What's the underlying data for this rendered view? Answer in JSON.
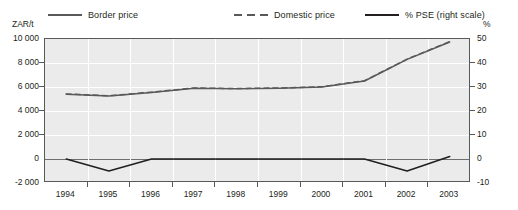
{
  "legend": {
    "items": [
      {
        "label": "Border price",
        "style": "solid",
        "color": "#58595b",
        "x": 48
      },
      {
        "label": "Domestic price",
        "style": "dashed",
        "color": "#58595b",
        "x": 234
      },
      {
        "label": "% PSE (right scale)",
        "style": "solid-thick",
        "color": "#231f20",
        "x": 365
      }
    ]
  },
  "axes": {
    "left_unit": "ZAR/t",
    "right_unit": "%"
  },
  "chart_data": {
    "type": "line",
    "title": "",
    "subtitle": "",
    "xlabel": "",
    "ylabel": "ZAR/t",
    "y2label": "%",
    "grid": true,
    "legend_position": "top",
    "x": [
      1994,
      1995,
      1996,
      1997,
      1998,
      1999,
      2000,
      2001,
      2002,
      2003
    ],
    "xtick_labels": [
      "1994",
      "1995",
      "1996",
      "1997",
      "1998",
      "1999",
      "2000",
      "2001",
      "2002",
      "2003"
    ],
    "ylim": [
      -2000,
      10000
    ],
    "ytick_labels": [
      "10 000",
      "8 000",
      "6 000",
      "4 000",
      "2 000",
      "0",
      "-2 000"
    ],
    "ytick_values": [
      10000,
      8000,
      6000,
      4000,
      2000,
      0,
      -2000
    ],
    "y2lim": [
      -10,
      50
    ],
    "y2tick_labels": [
      "50",
      "40",
      "30",
      "20",
      "10",
      "0",
      "-10"
    ],
    "y2tick_values": [
      50,
      40,
      30,
      20,
      10,
      0,
      -10
    ],
    "series": [
      {
        "name": "Border price",
        "axis": "left",
        "style": "solid",
        "color": "#58595b",
        "values": [
          5400,
          5250,
          5550,
          5900,
          5850,
          5900,
          6000,
          6500,
          8300,
          9750
        ]
      },
      {
        "name": "Domestic price",
        "axis": "left",
        "style": "dashed",
        "color": "#58595b",
        "values": [
          5420,
          5270,
          5570,
          5920,
          5870,
          5920,
          6020,
          6520,
          8320,
          9780
        ]
      },
      {
        "name": "% PSE (right scale)",
        "axis": "right",
        "style": "solid-thick",
        "color": "#231f20",
        "values": [
          0,
          -5,
          0,
          0,
          0,
          0,
          0,
          0,
          -5,
          1
        ]
      }
    ]
  }
}
